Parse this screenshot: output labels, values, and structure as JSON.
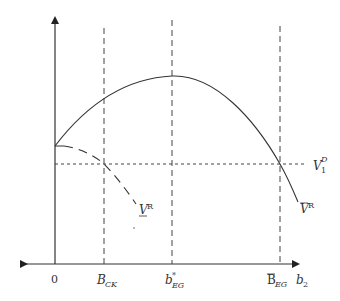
{
  "diagram": {
    "type": "economic-payoff-diagram",
    "colors": {
      "line": "#333333",
      "dashed": "#444444",
      "background": "#ffffff"
    },
    "axes": {
      "origin_label": "0",
      "x_axis_label_main": "b",
      "x_axis_label_sub": "2"
    },
    "vertical_markers": [
      {
        "label_main": "B",
        "label_sub": "CK",
        "decoration": ""
      },
      {
        "label_main": "b",
        "label_sub": "EG",
        "label_sup": "*",
        "decoration": ""
      },
      {
        "label_main": "B",
        "label_sub": "EG",
        "decoration": "overline"
      }
    ],
    "horizontal_marker": {
      "label_main": "V",
      "label_sub": "1",
      "label_sup": "D"
    },
    "curves": [
      {
        "name": "upper-value-curve",
        "label_main": "V",
        "label_sup": "R",
        "decoration": "overline",
        "style": "solid"
      },
      {
        "name": "lower-value-curve",
        "label_main": "V",
        "label_sup": "R",
        "decoration": "underline",
        "style": "dashed"
      }
    ]
  }
}
